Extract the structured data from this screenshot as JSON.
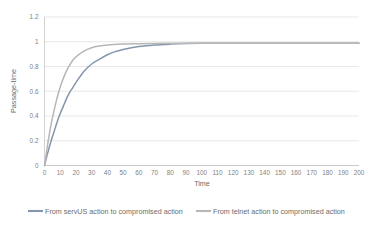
{
  "chart_data": {
    "type": "line",
    "title": "",
    "xlabel": "Time",
    "ylabel": "Passage-time",
    "xlim": [
      0,
      200
    ],
    "ylim": [
      0,
      1.2
    ],
    "grid": true,
    "legend_position": "bottom",
    "x_ticks": [
      "0",
      "10",
      "20",
      "30",
      "40",
      "50",
      "60",
      "70",
      "80",
      "90",
      "100",
      "110",
      "120",
      "130",
      "140",
      "150",
      "160",
      "170",
      "180",
      "190",
      "200"
    ],
    "y_ticks": [
      "0",
      "0.2",
      "0.4",
      "0.6",
      "0.8",
      "1",
      "1.2"
    ],
    "x": [
      0,
      2,
      4,
      6,
      8,
      10,
      12,
      14,
      16,
      18,
      20,
      25,
      30,
      35,
      40,
      45,
      50,
      60,
      70,
      80,
      90,
      100,
      110,
      120,
      130,
      140,
      150,
      160,
      170,
      180,
      190,
      200
    ],
    "series": [
      {
        "name": "From servUS action to compromised action",
        "color": "#8496ad",
        "values": [
          0,
          0.1,
          0.19,
          0.27,
          0.35,
          0.42,
          0.48,
          0.54,
          0.59,
          0.63,
          0.67,
          0.76,
          0.82,
          0.86,
          0.895,
          0.92,
          0.938,
          0.961,
          0.974,
          0.981,
          0.985,
          0.987,
          0.9875,
          0.988,
          0.988,
          0.988,
          0.988,
          0.988,
          0.988,
          0.988,
          0.988,
          0.988
        ]
      },
      {
        "name": "From telnet action to compromised action",
        "color": "#b7b7b7",
        "values": [
          0,
          0.17,
          0.32,
          0.44,
          0.545,
          0.635,
          0.705,
          0.765,
          0.81,
          0.85,
          0.878,
          0.925,
          0.952,
          0.966,
          0.974,
          0.978,
          0.981,
          0.984,
          0.986,
          0.987,
          0.9875,
          0.988,
          0.988,
          0.988,
          0.988,
          0.988,
          0.988,
          0.988,
          0.988,
          0.988,
          0.988,
          0.988
        ]
      }
    ],
    "legend": [
      {
        "label": "From servUS action to compromised action",
        "color": "#8496ad"
      },
      {
        "label": "From telnet action to compromised action",
        "color": "#b7b7b7"
      }
    ]
  }
}
